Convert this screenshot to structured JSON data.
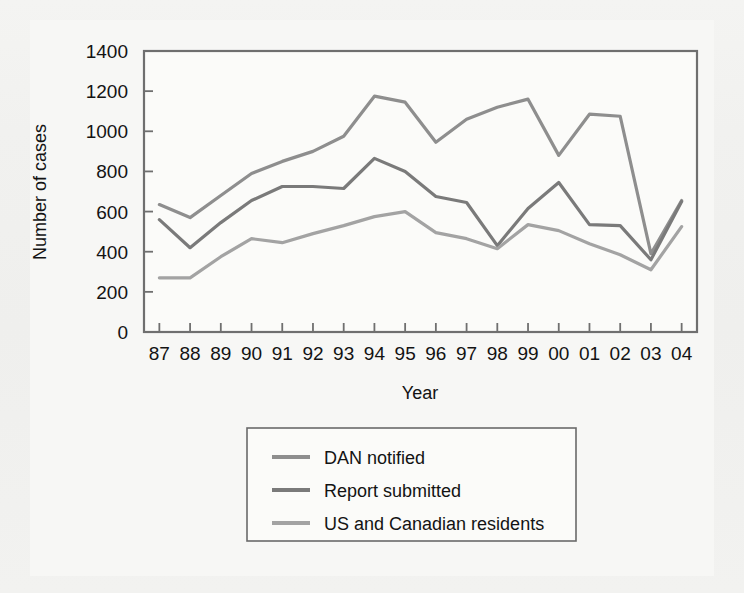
{
  "figure": {
    "background_color": "#f2f2f0",
    "plot_background_color": "#fbfbf9",
    "frame_color": "#6f6f6f"
  },
  "chart_data": {
    "type": "line",
    "title": "",
    "xlabel": "Year",
    "ylabel": "Number of cases",
    "categories": [
      "87",
      "88",
      "89",
      "90",
      "91",
      "92",
      "93",
      "94",
      "95",
      "96",
      "97",
      "98",
      "99",
      "00",
      "01",
      "02",
      "03",
      "04"
    ],
    "x": [
      1987,
      1988,
      1989,
      1990,
      1991,
      1992,
      1993,
      1994,
      1995,
      1996,
      1997,
      1998,
      1999,
      2000,
      2001,
      2002,
      2003,
      2004
    ],
    "ylim": [
      0,
      1400
    ],
    "yticks": [
      0,
      200,
      400,
      600,
      800,
      1000,
      1200,
      1400
    ],
    "ytick_labels": [
      "0",
      "200",
      "400",
      "600",
      "800",
      "1000",
      "1200",
      "1400"
    ],
    "grid": false,
    "legend_position": "below-plot-center",
    "series": [
      {
        "name": "DAN notified",
        "color": "#8e8e8e",
        "values": [
          635,
          570,
          680,
          790,
          850,
          900,
          975,
          1175,
          1145,
          945,
          1060,
          1120,
          1160,
          880,
          1085,
          1075,
          390,
          655
        ]
      },
      {
        "name": "Report submitted",
        "color": "#7a7a7a",
        "values": [
          560,
          420,
          545,
          655,
          725,
          725,
          715,
          865,
          800,
          675,
          645,
          430,
          615,
          745,
          535,
          530,
          360,
          650
        ]
      },
      {
        "name": "US and Canadian residents",
        "color": "#a3a3a3",
        "values": [
          270,
          270,
          375,
          465,
          445,
          490,
          530,
          575,
          600,
          495,
          465,
          415,
          535,
          505,
          440,
          385,
          310,
          525
        ]
      }
    ]
  },
  "legend": {
    "items": [
      {
        "label": "DAN notified",
        "color": "#8e8e8e"
      },
      {
        "label": "Report submitted",
        "color": "#7a7a7a"
      },
      {
        "label": "US and Canadian residents",
        "color": "#a3a3a3"
      }
    ]
  }
}
